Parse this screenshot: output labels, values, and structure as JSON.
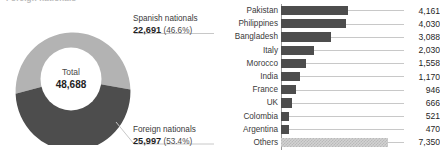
{
  "clipped_title": "Foreign nationals",
  "donut": {
    "center_label": "Total",
    "center_value": "48,688",
    "segments": [
      {
        "name": "Spanish nationals",
        "value": "22,691",
        "percent": "(46.6%)",
        "color": "#b3b3b3"
      },
      {
        "name": "Foreign nationals",
        "value": "25,997",
        "percent": "(53.4%)",
        "color": "#4d4d4d"
      }
    ]
  },
  "chart_data": {
    "type": "bar",
    "orientation": "horizontal",
    "title": "",
    "xlabel": "",
    "ylabel": "",
    "grid": false,
    "legend": "none",
    "xlim": [
      0,
      7350
    ],
    "categories": [
      "Pakistan",
      "Philippines",
      "Bangladesh",
      "Italy",
      "Morocco",
      "India",
      "France",
      "UK",
      "Colombia",
      "Argentina",
      "Others"
    ],
    "values": [
      4161,
      4030,
      3088,
      2030,
      1558,
      1170,
      946,
      666,
      521,
      470,
      7350
    ],
    "value_labels": [
      "4,161",
      "4,030",
      "3,088",
      "2,030",
      "1,558",
      "1,170",
      "946",
      "666",
      "521",
      "470",
      "7,350"
    ],
    "bar_colors": [
      "#4d4d4d",
      "#4d4d4d",
      "#4d4d4d",
      "#4d4d4d",
      "#4d4d4d",
      "#4d4d4d",
      "#4d4d4d",
      "#4d4d4d",
      "#4d4d4d",
      "#4d4d4d",
      "#d2d2d2"
    ],
    "donut_total": 48688,
    "donut_categories": [
      "Spanish nationals",
      "Foreign nationals"
    ],
    "donut_values": [
      22691,
      25997
    ],
    "donut_percents": [
      46.6,
      53.4
    ]
  }
}
